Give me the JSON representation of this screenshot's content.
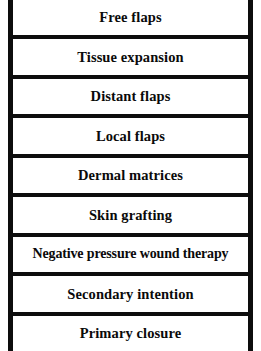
{
  "figure": {
    "name": "reconstructive-ladder",
    "shape": "ladder",
    "colors": {
      "rail": "#0d0d0d",
      "rung_divider": "#0d0d0d",
      "text": "#0a0a0a",
      "background": "#ffffff"
    },
    "rungs": [
      {
        "label": "Free flaps"
      },
      {
        "label": "Tissue expansion"
      },
      {
        "label": "Distant flaps"
      },
      {
        "label": "Local flaps"
      },
      {
        "label": "Dermal matrices"
      },
      {
        "label": "Skin grafting"
      },
      {
        "label": "Negative pressure wound therapy"
      },
      {
        "label": "Secondary intention"
      },
      {
        "label": "Primary closure"
      }
    ]
  }
}
